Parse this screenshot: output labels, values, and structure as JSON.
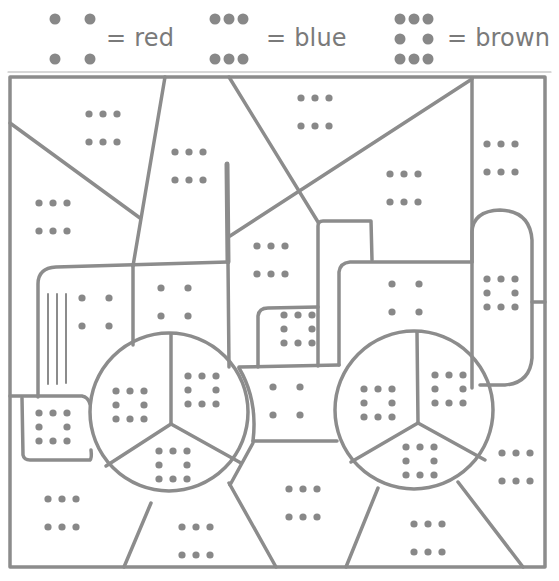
{
  "legend": [
    {
      "pattern": "four-dots",
      "label": "= red",
      "color": "#d32f2f",
      "x": 45,
      "label_x": 106,
      "dots": [
        [
          10,
          11
        ],
        [
          45,
          11
        ],
        [
          10,
          51
        ],
        [
          45,
          51
        ]
      ]
    },
    {
      "pattern": "six-dots",
      "label": "= blue",
      "color": "#1e4fd6",
      "x": 205,
      "label_x": 266,
      "dots": [
        [
          10,
          11
        ],
        [
          24,
          11
        ],
        [
          38,
          11
        ],
        [
          10,
          51
        ],
        [
          24,
          51
        ],
        [
          38,
          51
        ]
      ]
    },
    {
      "pattern": "eight-dots-ring",
      "label": "= brown",
      "color": "#7b4a21",
      "x": 390,
      "label_x": 447,
      "dots": [
        [
          10,
          11
        ],
        [
          24,
          11
        ],
        [
          38,
          11
        ],
        [
          10,
          31
        ],
        [
          38,
          31
        ],
        [
          10,
          51
        ],
        [
          24,
          51
        ],
        [
          38,
          51
        ]
      ]
    }
  ],
  "line_color": "#8c8c8c",
  "dot_color": "#888888",
  "regions": [
    {
      "name": "sky-top-left-upper",
      "pattern": "six-dots",
      "cx": 103,
      "cy": 128
    },
    {
      "name": "sky-top-left-lower",
      "pattern": "six-dots",
      "cx": 53,
      "cy": 217
    },
    {
      "name": "sky-top-mid",
      "pattern": "six-dots",
      "cx": 189,
      "cy": 166
    },
    {
      "name": "sky-top-center",
      "pattern": "six-dots",
      "cx": 315,
      "cy": 112
    },
    {
      "name": "sky-right-triangle",
      "pattern": "six-dots",
      "cx": 404,
      "cy": 188
    },
    {
      "name": "sky-right-strip",
      "pattern": "six-dots",
      "cx": 501,
      "cy": 158
    },
    {
      "name": "sky-behind-cab",
      "pattern": "six-dots",
      "cx": 271,
      "cy": 260
    },
    {
      "name": "tractor-hood-left",
      "pattern": "four-dots",
      "cx": 96,
      "cy": 312
    },
    {
      "name": "tractor-hood-mid",
      "pattern": "four-dots",
      "cx": 175,
      "cy": 302
    },
    {
      "name": "tractor-cab-body",
      "pattern": "four-dots",
      "cx": 406,
      "cy": 298
    },
    {
      "name": "tractor-axle-center",
      "pattern": "four-dots",
      "cx": 287,
      "cy": 401
    },
    {
      "name": "tractor-bumper",
      "pattern": "eight-dots-ring",
      "cx": 53,
      "cy": 427
    },
    {
      "name": "tractor-seat-block",
      "pattern": "eight-dots-ring",
      "cx": 298,
      "cy": 329
    },
    {
      "name": "tractor-fender",
      "pattern": "eight-dots-ring",
      "cx": 501,
      "cy": 293
    },
    {
      "name": "left-wheel-hub-left",
      "pattern": "eight-dots-ring",
      "cx": 130,
      "cy": 405
    },
    {
      "name": "left-wheel-hub-right",
      "pattern": "eight-dots-ring",
      "cx": 202,
      "cy": 390
    },
    {
      "name": "left-wheel-hub-bottom",
      "pattern": "eight-dots-ring",
      "cx": 173,
      "cy": 465
    },
    {
      "name": "right-wheel-hub-left",
      "pattern": "eight-dots-ring",
      "cx": 378,
      "cy": 403
    },
    {
      "name": "right-wheel-hub-right",
      "pattern": "eight-dots-ring",
      "cx": 449,
      "cy": 389
    },
    {
      "name": "right-wheel-hub-bottom",
      "pattern": "eight-dots-ring",
      "cx": 420,
      "cy": 461
    },
    {
      "name": "ground-bottom-left",
      "pattern": "six-dots",
      "cx": 62,
      "cy": 513
    },
    {
      "name": "ground-bottom-mid-left",
      "pattern": "six-dots",
      "cx": 196,
      "cy": 541
    },
    {
      "name": "ground-bottom-center",
      "pattern": "six-dots",
      "cx": 303,
      "cy": 503
    },
    {
      "name": "ground-bottom-mid-right",
      "pattern": "six-dots",
      "cx": 428,
      "cy": 538
    },
    {
      "name": "ground-bottom-right",
      "pattern": "six-dots",
      "cx": 516,
      "cy": 467
    }
  ],
  "patterns": {
    "four-dots": [
      [
        -14,
        -14
      ],
      [
        13,
        -14
      ],
      [
        -14,
        14
      ],
      [
        13,
        14
      ]
    ],
    "six-dots": [
      [
        -14,
        -14
      ],
      [
        0,
        -14
      ],
      [
        14,
        -14
      ],
      [
        -14,
        14
      ],
      [
        0,
        14
      ],
      [
        14,
        14
      ]
    ],
    "eight-dots-ring": [
      [
        -14,
        -14
      ],
      [
        0,
        -14
      ],
      [
        14,
        -14
      ],
      [
        -14,
        0
      ],
      [
        14,
        0
      ],
      [
        -14,
        14
      ],
      [
        0,
        14
      ],
      [
        14,
        14
      ]
    ]
  }
}
